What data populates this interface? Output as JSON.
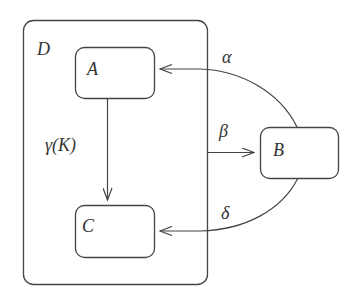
{
  "diagram": {
    "type": "statechart",
    "colors": {
      "stroke": "#444444",
      "text": "#333333",
      "background": "#ffffff"
    },
    "states": {
      "D": {
        "label": "D",
        "kind": "superstate"
      },
      "A": {
        "label": "A"
      },
      "B": {
        "label": "B"
      },
      "C": {
        "label": "C"
      }
    },
    "transitions": [
      {
        "from": "B",
        "to": "A",
        "label": "α"
      },
      {
        "from": "D",
        "to": "B",
        "label": "β"
      },
      {
        "from": "B",
        "to": "C",
        "label": "δ"
      },
      {
        "from": "A",
        "to": "C",
        "label": "γ(K)"
      }
    ]
  }
}
